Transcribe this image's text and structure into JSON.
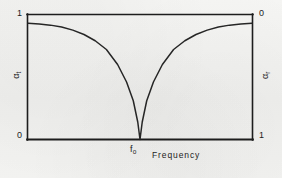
{
  "chart_data": {
    "type": "line",
    "title": "",
    "xlabel": "Frequency",
    "ylabel_left": "αt",
    "ylabel_right": "αr",
    "x": [
      0.0,
      0.05,
      0.1,
      0.15,
      0.2,
      0.25,
      0.3,
      0.35,
      0.4,
      0.44,
      0.47,
      0.49,
      0.5,
      0.51,
      0.53,
      0.56,
      0.6,
      0.65,
      0.7,
      0.75,
      0.8,
      0.85,
      0.9,
      0.95,
      1.0
    ],
    "series": [
      {
        "name": "αt",
        "values": [
          0.93,
          0.925,
          0.915,
          0.9,
          0.875,
          0.84,
          0.79,
          0.72,
          0.6,
          0.46,
          0.31,
          0.14,
          0.0,
          0.14,
          0.31,
          0.46,
          0.6,
          0.72,
          0.79,
          0.84,
          0.875,
          0.9,
          0.915,
          0.925,
          0.93
        ]
      }
    ],
    "xlim": [
      0,
      1
    ],
    "ylim_left": [
      0,
      1
    ],
    "ylim_right": [
      1,
      0
    ],
    "grid": false,
    "legend": "none",
    "y_left_ticks": [
      "1",
      "0"
    ],
    "y_right_ticks": [
      "0",
      "1"
    ],
    "x_ticks": [
      "f0"
    ],
    "minimum_at": "f0",
    "minimum_value": 0,
    "annotations": []
  },
  "axes": {
    "left": {
      "name_symbol": "α",
      "name_subscript": "t",
      "top_label": "1",
      "bottom_label": "0"
    },
    "right": {
      "name_symbol": "α",
      "name_subscript": "r",
      "top_label": "0",
      "bottom_label": "1"
    },
    "bottom": {
      "name": "Frequency",
      "tick_symbol": "f",
      "tick_subscript": "o"
    }
  },
  "style": {
    "ink_color": "#1d1d1d",
    "curve_color": "#262626",
    "frame_color": "#1d1d1d",
    "paper_color": "#f2f2f0"
  }
}
